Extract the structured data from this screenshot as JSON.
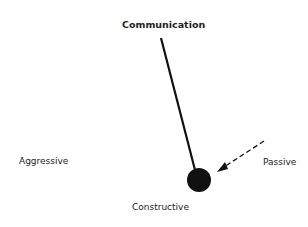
{
  "diagram": {
    "title": "Communication",
    "labels": {
      "left": "Aggressive",
      "right": "Passive",
      "bottom": "Constructive"
    },
    "pendulum": {
      "pivot": [
        161,
        38
      ],
      "bob_center": [
        199,
        180
      ],
      "bob_radius": 12,
      "line_color": "#111111",
      "bob_color": "#111111"
    },
    "arrow": {
      "from": [
        264,
        141
      ],
      "to": [
        219,
        170
      ],
      "style": "dashed"
    }
  }
}
